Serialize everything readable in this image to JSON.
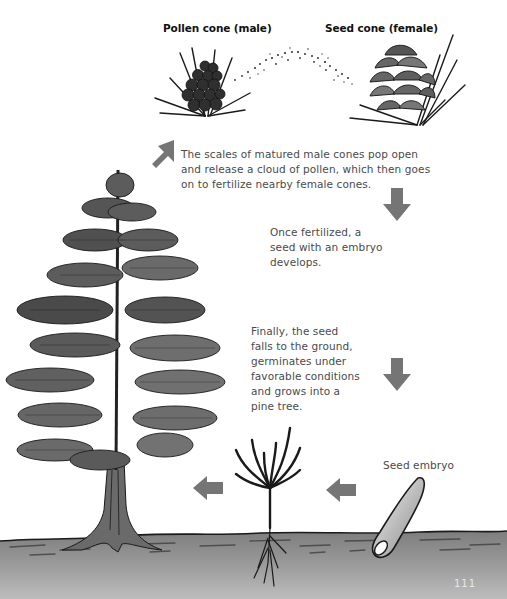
{
  "labels": {
    "pollen_cone": "Pollen cone (male)",
    "seed_cone": "Seed cone (female)",
    "seed_embryo": "Seed embryo"
  },
  "captions": {
    "pollination": [
      "The scales of matured male cones pop open",
      "and release a cloud of pollen, which then goes",
      "on to fertilize nearby female cones."
    ],
    "fertilization": [
      "Once fertilized, a",
      "seed with an embryo",
      "develops."
    ],
    "germination": [
      "Finally, the seed",
      "falls to the ground,",
      "germinates under",
      "favorable conditions",
      "and grows into a",
      "pine tree."
    ]
  },
  "stages": [
    {
      "name": "Pine tree",
      "icon": "pine-tree-icon"
    },
    {
      "name": "Pollen cone (male)",
      "icon": "pollen-cone-icon"
    },
    {
      "name": "Seed cone (female)",
      "icon": "seed-cone-icon"
    },
    {
      "name": "Seed embryo",
      "icon": "seed-icon"
    },
    {
      "name": "Seedling",
      "icon": "seedling-icon"
    }
  ],
  "arrows": [
    {
      "id": "tree-to-pollen",
      "direction": "up-right"
    },
    {
      "id": "cone-to-seed-1",
      "direction": "down"
    },
    {
      "id": "cone-to-seed-2",
      "direction": "down"
    },
    {
      "id": "seed-to-seedling",
      "direction": "left"
    },
    {
      "id": "seedling-to-tree",
      "direction": "left"
    }
  ],
  "colors": {
    "arrow": "#757575",
    "ground_top": "#8a8a8a",
    "ground_bottom": "#b5b5b5",
    "ink": "#1a1a1a",
    "foliage": "#5a5a5a"
  },
  "page_number": "111"
}
